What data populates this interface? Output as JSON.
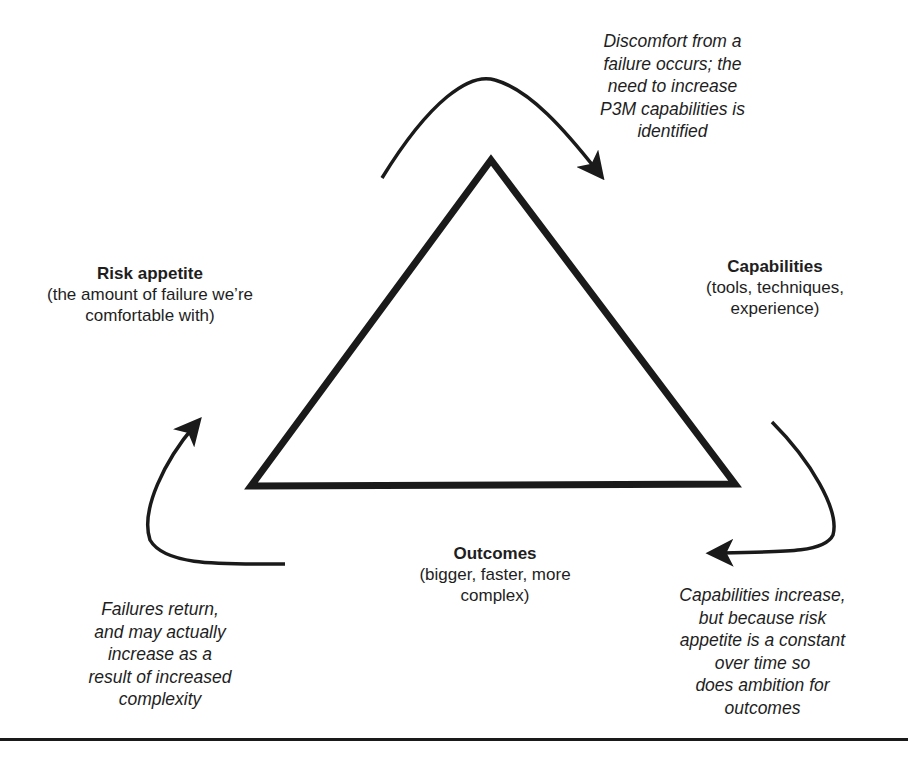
{
  "diagram": {
    "type": "cycle-triangle",
    "colors": {
      "stroke": "#1a1a1a",
      "text": "#1e1e1e",
      "background": "#ffffff"
    },
    "nodes": {
      "risk_appetite": {
        "title": "Risk appetite",
        "subtitle": "(the amount of failure we’re comfortable with)"
      },
      "capabilities": {
        "title": "Capabilities",
        "subtitle": "(tools, techniques, experience)"
      },
      "outcomes": {
        "title": "Outcomes",
        "subtitle": "(bigger, faster, more complex)"
      }
    },
    "transitions": {
      "risk_to_capabilities": "Discomfort from a\nfailure occurs; the\nneed to increase\nP3M capabilities is\nidentified",
      "capabilities_to_outcomes": "Capabilities increase,\nbut because risk\nappetite is a constant\nover time so\ndoes ambition for\noutcomes",
      "outcomes_to_risk": "Failures return,\nand may actually\nincrease as a\nresult of increased\ncomplexity"
    },
    "arrows": [
      {
        "from": "risk_appetite",
        "to": "capabilities",
        "position": "top"
      },
      {
        "from": "capabilities",
        "to": "outcomes",
        "position": "right"
      },
      {
        "from": "outcomes",
        "to": "risk_appetite",
        "position": "left"
      }
    ]
  }
}
